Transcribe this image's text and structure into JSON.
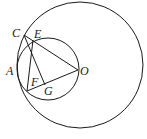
{
  "diagram": {
    "type": "geometry",
    "stroke_color": "#1a1a1a",
    "circles": [
      {
        "name": "large-circle",
        "cx": 80,
        "cy": 65,
        "r": 63
      },
      {
        "name": "small-circle",
        "cx": 48,
        "cy": 69,
        "r": 31
      }
    ],
    "points": {
      "C": {
        "x": 24,
        "y": 35,
        "label": "C",
        "lx": 12,
        "ly": 37
      },
      "E": {
        "x": 33,
        "y": 40,
        "label": "E",
        "lx": 34,
        "ly": 38
      },
      "A": {
        "label": "A",
        "lx": 6,
        "ly": 75
      },
      "O": {
        "x": 78,
        "y": 70,
        "label": "O",
        "lx": 80,
        "ly": 75
      },
      "F": {
        "label": "F",
        "lx": 31,
        "ly": 86
      },
      "G": {
        "label": "G",
        "lx": 44,
        "ly": 95
      },
      "B": {
        "x": 27,
        "y": 91
      }
    },
    "segments": [
      [
        "C",
        "O"
      ],
      [
        "C",
        "G"
      ],
      [
        "E",
        "B"
      ],
      [
        "B",
        "O"
      ]
    ]
  }
}
